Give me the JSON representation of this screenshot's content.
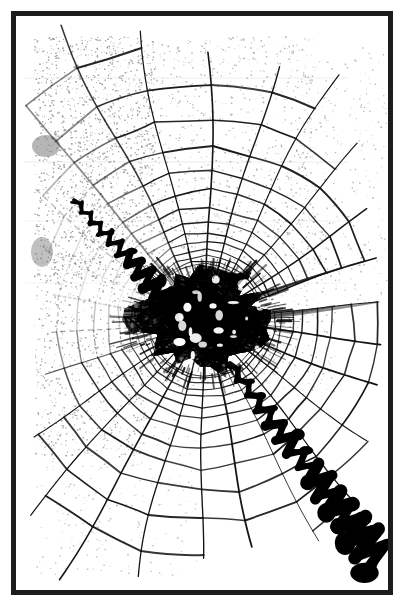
{
  "document": {
    "kind": "photocopied-figure",
    "title": "Spider orb web with central tangle",
    "background_color": "#ffffff",
    "ink_color": "#111111",
    "grain_color": "#8d8d8d"
  },
  "frame": {
    "name": "black-border-frame",
    "x": 11,
    "y": 11,
    "width": 382,
    "height": 584,
    "stroke_width": 5,
    "stroke_color": "#1c1c1c",
    "fill": "#ffffff"
  },
  "plate": {
    "width": 372,
    "height": 574,
    "content_inset": {
      "left": 24,
      "top": 22,
      "right": 14,
      "bottom": 28
    }
  },
  "web": {
    "name": "spider-orb-web",
    "hub": {
      "x": 189,
      "y": 304,
      "radius": 58,
      "label": "central-tangle-hub"
    },
    "radial_count": 26,
    "radial_angle_offset_deg": -6,
    "spiral_turns": 15,
    "spiral_inner_radius": 56,
    "spiral_outer_radius": 330,
    "line_color": "#141414",
    "line_width_min": 0.7,
    "line_width_max": 1.9,
    "jitter_amplitude": 4.2,
    "fade_start_angle_deg": 150,
    "fade_end_angle_deg": 250,
    "seed": 20477
  },
  "tangle": {
    "name": "central-black-tangle",
    "center": {
      "x": 189,
      "y": 304
    },
    "radius_x": 72,
    "radius_y": 56,
    "strand_count": 520,
    "blob_count": 150,
    "fill_color": "#000000",
    "void_count": 26
  },
  "bands": [
    {
      "name": "upper-left-zigzag-band",
      "start": {
        "x": 58,
        "y": 184
      },
      "end": {
        "x": 163,
        "y": 296
      },
      "segments": 22,
      "amplitude": 7.5,
      "thickness_start": 2.2,
      "thickness_end": 10.5,
      "color": "#000000"
    },
    {
      "name": "lower-right-zigzag-band",
      "start": {
        "x": 214,
        "y": 348
      },
      "end": {
        "x": 364,
        "y": 545
      },
      "segments": 28,
      "amplitude": 11.0,
      "thickness_start": 4.0,
      "thickness_end": 15.0,
      "color": "#000000"
    }
  ],
  "grain": {
    "name": "photocopy-speckle",
    "regions": [
      {
        "label": "upper-left-heavy",
        "x": 18,
        "y": 20,
        "width": 120,
        "height": 240,
        "density": 0.055,
        "color": "#7d7d7d"
      },
      {
        "label": "upper-mid-light",
        "x": 130,
        "y": 20,
        "width": 170,
        "height": 200,
        "density": 0.022,
        "color": "#9a9a9a"
      },
      {
        "label": "left-mid",
        "x": 18,
        "y": 240,
        "width": 110,
        "height": 200,
        "density": 0.03,
        "color": "#8a8a8a"
      },
      {
        "label": "center-band",
        "x": 120,
        "y": 200,
        "width": 200,
        "height": 180,
        "density": 0.016,
        "color": "#9e9e9e"
      },
      {
        "label": "right-upper",
        "x": 280,
        "y": 30,
        "width": 90,
        "height": 260,
        "density": 0.012,
        "color": "#a6a6a6"
      },
      {
        "label": "lower-left-faint",
        "x": 20,
        "y": 400,
        "width": 160,
        "height": 160,
        "density": 0.01,
        "color": "#b0b0b0"
      }
    ],
    "scan_lines": [
      {
        "y": 62,
        "opacity": 0.18
      },
      {
        "y": 146,
        "opacity": 0.22
      },
      {
        "y": 205,
        "opacity": 0.14
      },
      {
        "y": 267,
        "opacity": 0.12
      }
    ]
  },
  "smudges": [
    {
      "name": "left-edge-smudge-upper",
      "x": 30,
      "y": 130,
      "rx": 14,
      "ry": 11,
      "color": "#6e6e6e",
      "opacity": 0.5
    },
    {
      "name": "left-edge-smudge-lower",
      "x": 26,
      "y": 236,
      "rx": 11,
      "ry": 15,
      "color": "#757575",
      "opacity": 0.45
    }
  ]
}
